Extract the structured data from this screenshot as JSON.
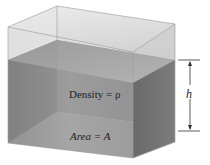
{
  "diagram": {
    "labels": {
      "density": "Density = ρ",
      "area": "Area = A",
      "height": "h"
    },
    "colors": {
      "container_glass": "#d9d9d9",
      "liquid_front": "#8a8a8a",
      "liquid_side": "#707070",
      "liquid_top": "#a6a6a6",
      "liquid_bottom": "#b3b3b3",
      "dimension_line": "#333333"
    }
  }
}
